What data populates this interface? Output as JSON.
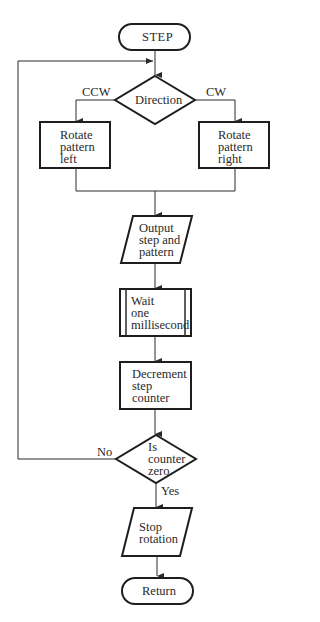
{
  "flowchart": {
    "start": "STEP",
    "decision_direction": {
      "text": "Direction",
      "left_branch": "CCW",
      "right_branch": "CW"
    },
    "rotate_left": "Rotate\npattern\nleft",
    "rotate_right": "Rotate\npattern\nright",
    "output": "Output\nstep and\npattern",
    "wait": "Wait\none\nmillisecond",
    "decrement": "Decrement\nstep\ncounter",
    "decision_zero": {
      "text": "Is\ncounter\nzero",
      "no_label": "No",
      "yes_label": "Yes"
    },
    "stop": "Stop\nrotation",
    "end": "Return"
  },
  "colors": {
    "stroke": "#1e1e1e",
    "background": "#ffffff"
  }
}
